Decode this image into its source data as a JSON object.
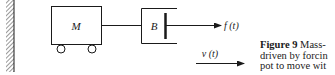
{
  "figure": {
    "labels": {
      "mass": "M",
      "damper": "B",
      "force": "f (t)",
      "velocity": "v (t)"
    },
    "caption": {
      "figure_label": "Figure 9",
      "lines": [
        "Mass-",
        "driven by forcin",
        "pot to move wit"
      ]
    },
    "colors": {
      "ink": "#1a1a1a",
      "background": "#ffffff"
    }
  }
}
